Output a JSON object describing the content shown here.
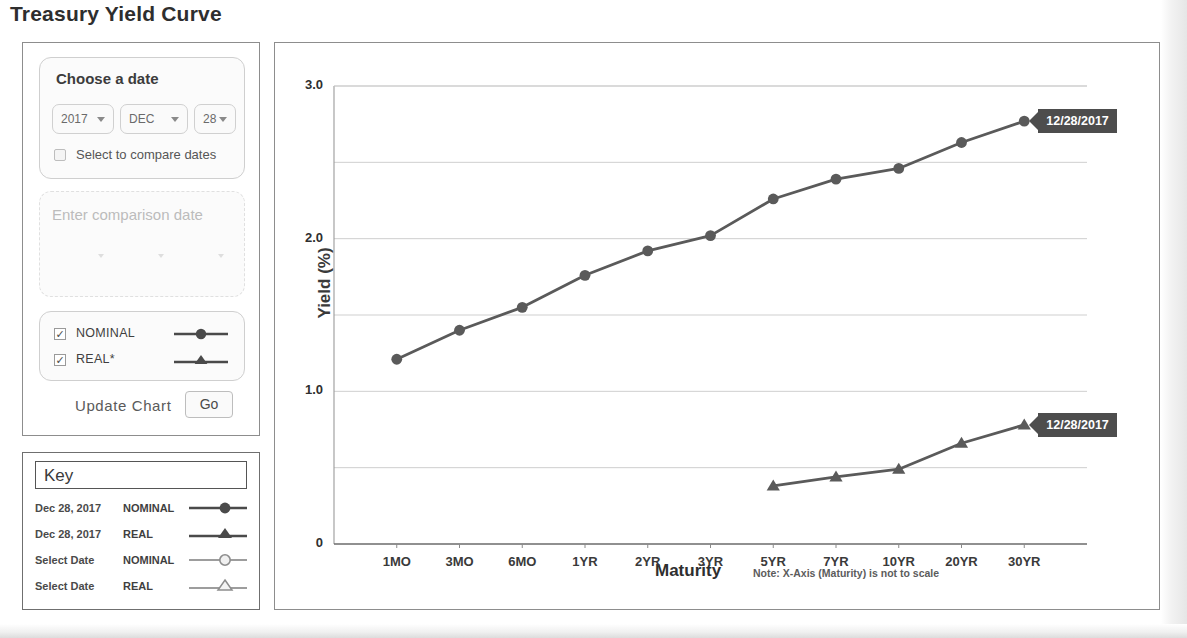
{
  "page_title": "Treasury Yield Curve",
  "controls": {
    "choose_date_label": "Choose a date",
    "year": {
      "value": "2017",
      "caret": "chevron-down-icon"
    },
    "month": {
      "value": "DEC"
    },
    "day": {
      "value": "28"
    },
    "compare_label": "Select to compare dates",
    "compare_checked": false,
    "comparison_placeholder": "Enter comparison date",
    "series": [
      {
        "label": "NOMINAL",
        "checked": true,
        "marker": "circle"
      },
      {
        "label": "REAL*",
        "checked": true,
        "marker": "triangle"
      }
    ],
    "update_label": "Update Chart",
    "go_label": "Go"
  },
  "key": {
    "title": "Key",
    "rows": [
      {
        "date": "Dec 28, 2017",
        "type": "NOMINAL",
        "marker": "circle",
        "filled": true
      },
      {
        "date": "Dec 28, 2017",
        "type": "REAL",
        "marker": "triangle",
        "filled": true
      },
      {
        "date": "Select Date",
        "type": "NOMINAL",
        "marker": "circle",
        "filled": false
      },
      {
        "date": "Select Date",
        "type": "REAL",
        "marker": "triangle",
        "filled": false
      }
    ]
  },
  "chart_data": {
    "type": "line",
    "title": "Treasury Yield Curve",
    "xlabel": "Maturity",
    "ylabel": "Yield (%)",
    "note": "Note: X-Axis (Maturity) is not to scale",
    "categories": [
      "1MO",
      "3MO",
      "6MO",
      "1YR",
      "2YR",
      "3YR",
      "5YR",
      "7YR",
      "10YR",
      "20YR",
      "30YR"
    ],
    "ylim": [
      0,
      3.0
    ],
    "yticks": [
      0,
      1.0,
      2.0,
      3.0
    ],
    "ytick_labels": [
      "0",
      "1.0",
      "2.0",
      "3.0"
    ],
    "gridlines": [
      0.5,
      1.0,
      1.5,
      2.0,
      2.5,
      3.0
    ],
    "grid": true,
    "legend_position": "external-key-panel",
    "series": [
      {
        "name": "NOMINAL",
        "date": "12/28/2017",
        "marker": "circle",
        "color": "#5a5a5a",
        "values": [
          1.21,
          1.4,
          1.55,
          1.76,
          1.92,
          2.02,
          2.26,
          2.39,
          2.46,
          2.63,
          2.77
        ]
      },
      {
        "name": "REAL",
        "date": "12/28/2017",
        "marker": "triangle",
        "color": "#5a5a5a",
        "values": [
          null,
          null,
          null,
          null,
          null,
          null,
          0.38,
          0.44,
          0.49,
          0.66,
          0.78
        ]
      }
    ],
    "annotations": [
      {
        "text": "12/28/2017",
        "target_series": "NOMINAL",
        "target_category": "30YR"
      },
      {
        "text": "12/28/2017",
        "target_series": "REAL",
        "target_category": "30YR"
      }
    ]
  }
}
